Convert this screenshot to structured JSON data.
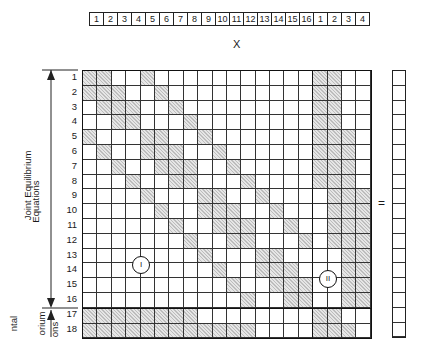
{
  "top_vector": {
    "labels": [
      "1",
      "2",
      "3",
      "4",
      "5",
      "6",
      "7",
      "8",
      "9",
      "10",
      "11",
      "12",
      "13",
      "14",
      "15",
      "16",
      "1",
      "2",
      "3",
      "4"
    ]
  },
  "x_label": "X",
  "equals_sign": "=",
  "left_bracket": {
    "line1": "Joint Equilibrium",
    "line2": "Equations",
    "lower_line1": "ntal",
    "lower_line2": "orium",
    "lower_line3": "ons"
  },
  "row_labels": [
    "1",
    "2",
    "3",
    "4",
    "5",
    "6",
    "7",
    "8",
    "9",
    "10",
    "11",
    "12",
    "13",
    "14",
    "15",
    "16",
    "17",
    "18"
  ],
  "region_labels": {
    "region_1": "I",
    "region_2": "II"
  },
  "matrix": {
    "columns": 20,
    "shaded_cells_by_row": {
      "1": [
        1,
        2,
        5,
        17,
        18
      ],
      "2": [
        1,
        2,
        3,
        6,
        17,
        18
      ],
      "3": [
        2,
        3,
        4,
        7,
        17,
        18
      ],
      "4": [
        3,
        4,
        8,
        17,
        18
      ],
      "5": [
        1,
        5,
        6,
        9,
        17,
        18,
        19
      ],
      "6": [
        2,
        5,
        6,
        7,
        10,
        17,
        18,
        19
      ],
      "7": [
        3,
        6,
        7,
        8,
        11,
        17,
        18,
        19
      ],
      "8": [
        4,
        7,
        8,
        12,
        17,
        18,
        19
      ],
      "9": [
        5,
        9,
        10,
        13,
        18,
        19,
        20
      ],
      "10": [
        6,
        9,
        10,
        11,
        14,
        18,
        19,
        20
      ],
      "11": [
        7,
        10,
        11,
        12,
        15,
        18,
        19,
        20
      ],
      "12": [
        8,
        11,
        12,
        16,
        18,
        19,
        20
      ],
      "13": [
        9,
        13,
        14,
        19,
        20
      ],
      "14": [
        10,
        13,
        14,
        15,
        19,
        20
      ],
      "15": [
        11,
        14,
        15,
        16,
        19,
        20
      ],
      "16": [
        12,
        15,
        16,
        19,
        20
      ],
      "17": [
        1,
        2,
        3,
        4,
        5,
        6,
        7,
        8,
        17,
        18
      ],
      "18": [
        1,
        2,
        3,
        4,
        5,
        6,
        7,
        8,
        9,
        10,
        11,
        12,
        17,
        18,
        19
      ]
    }
  },
  "right_vector": {
    "cells": 18
  }
}
